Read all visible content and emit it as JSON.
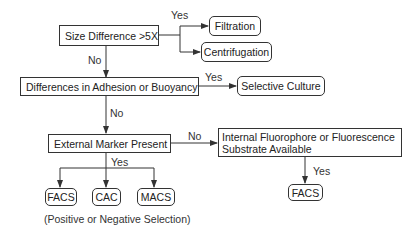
{
  "nodes": {
    "size_difference": "Size Difference >5X",
    "filtration": "Filtration",
    "centrifugation": "Centrifugation",
    "adhesion_buoyancy": "Differences in Adhesion or Buoyancy",
    "selective_culture": "Selective Culture",
    "external_marker": "External Marker Present",
    "internal_fluorophore_line1": "Internal Fluorophore or Fluorescence",
    "internal_fluorophore_line2": "Substrate Available",
    "facs_right": "FACS",
    "facs_left": "FACS",
    "cac": "CAC",
    "macs": "MACS"
  },
  "edge_labels": {
    "size_yes": "Yes",
    "size_no": "No",
    "adhesion_yes": "Yes",
    "adhesion_no": "No",
    "external_no": "No",
    "external_yes": "Yes",
    "internal_yes": "Yes"
  },
  "caption": "(Positive or Negative Selection)",
  "colors": {
    "line": "#333333",
    "text": "#222222",
    "background": "#ffffff"
  }
}
